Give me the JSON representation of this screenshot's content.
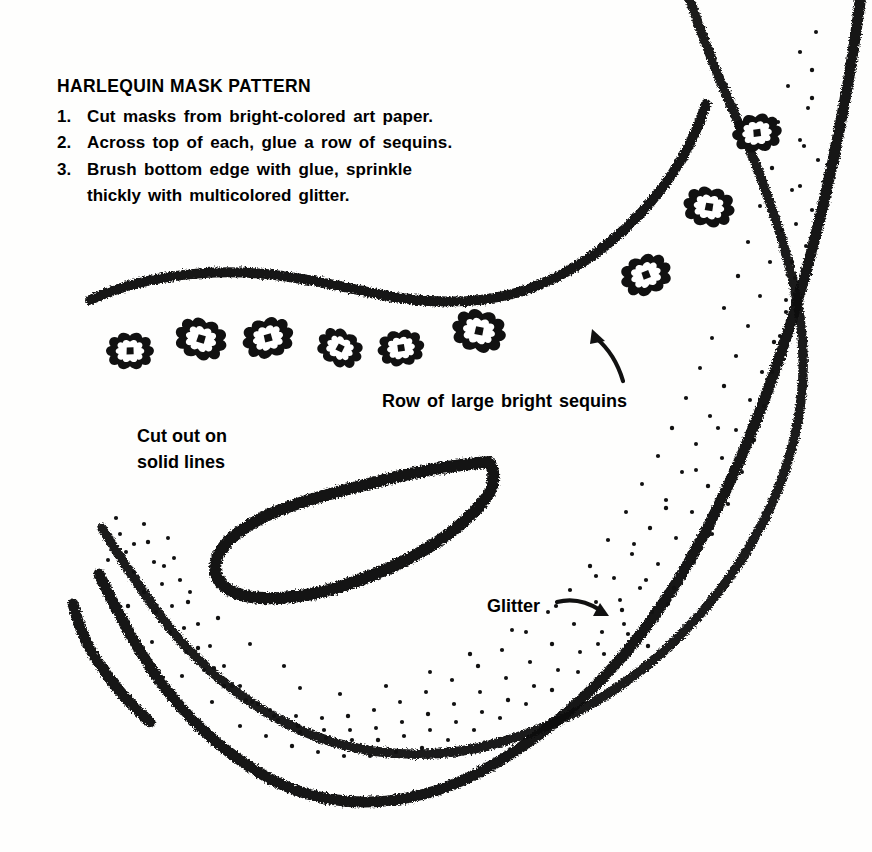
{
  "page": {
    "background_color": "#fefefd",
    "ink_color": "#111111",
    "width": 872,
    "height": 852
  },
  "instructions": {
    "title": "HARLEQUIN MASK PATTERN",
    "steps": [
      {
        "number": "1.",
        "text": "Cut masks from bright-colored art paper."
      },
      {
        "number": "2.",
        "text": "Across top of each, glue a row of sequins."
      },
      {
        "number": "3.",
        "text": "Brush bottom edge with glue, sprinkle"
      }
    ],
    "step3_continuation": "thickly with multicolored glitter."
  },
  "callouts": {
    "sequins": "Row of large bright sequins",
    "cutout_line1": "Cut out on",
    "cutout_line2": "solid lines",
    "glitter": "Glitter"
  },
  "illustration": {
    "name": "harlequin-mask-pattern",
    "sequin_count": 9,
    "sequins_row": [
      {
        "cx": 130,
        "cy": 351
      },
      {
        "cx": 201,
        "cy": 339
      },
      {
        "cx": 268,
        "cy": 338
      },
      {
        "cx": 340,
        "cy": 348
      },
      {
        "cx": 401,
        "cy": 348
      },
      {
        "cx": 479,
        "cy": 331
      }
    ],
    "sequins_upper": [
      {
        "cx": 757,
        "cy": 133
      },
      {
        "cx": 709,
        "cy": 207
      },
      {
        "cx": 646,
        "cy": 275
      }
    ],
    "eye_hole": "teardrop cut-out, rounded left, pointed upper-right",
    "left_edge": "vertical dashed fold line",
    "glitter_zone": "dotted stipple along lower and right inner edge"
  }
}
